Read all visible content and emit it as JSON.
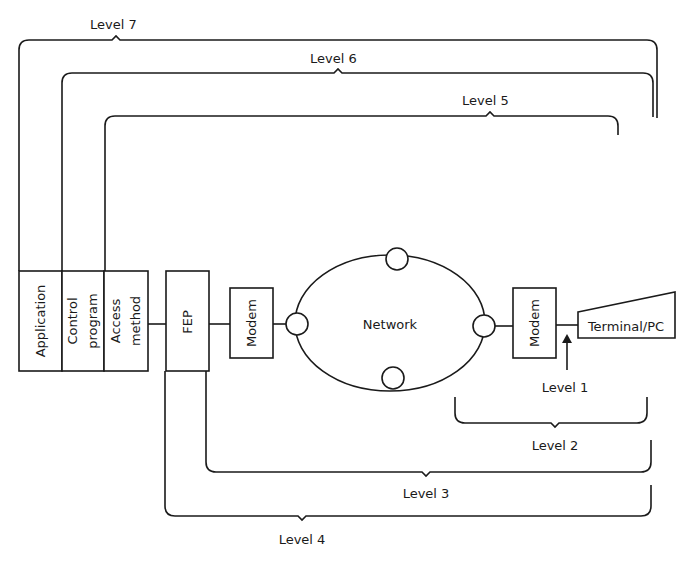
{
  "diagram": {
    "stack": {
      "application": "Application",
      "control_program": [
        "Control",
        "program"
      ],
      "access_method": [
        "Access",
        "method"
      ]
    },
    "fep": "FEP",
    "modem_left": "Modem",
    "network": "Network",
    "modem_right": "Modem",
    "terminal": "Terminal/PC",
    "levels": {
      "level1": "Level 1",
      "level2": "Level 2",
      "level3": "Level 3",
      "level4": "Level 4",
      "level5": "Level 5",
      "level6": "Level 6",
      "level7": "Level 7"
    },
    "colors": {
      "stroke": "#1a1a1a",
      "background": "#ffffff"
    }
  }
}
